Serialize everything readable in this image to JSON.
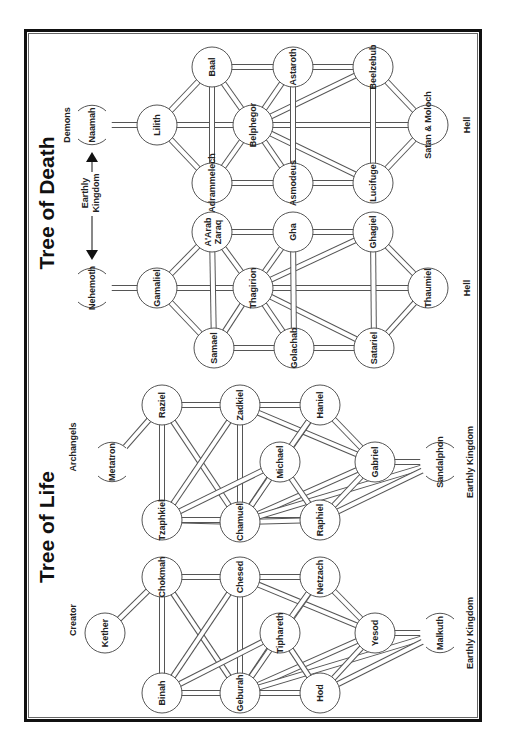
{
  "titles": {
    "death": "Tree of Death",
    "life": "Tree of Life"
  },
  "labels": {
    "demons": "Demons",
    "earthly": "Earthly",
    "kingdom": "Kingdom",
    "hell_1": "Hell",
    "hell_2": "Hell",
    "archangels": "Archangels",
    "creator": "Creator",
    "earthly_kingdom_1": "Earthly Kingdom",
    "earthly_kingdom_2": "Earthly Kingdom"
  },
  "colors": {
    "line": "#555555",
    "frame": "#111111",
    "text": "#222222",
    "background": "#ffffff"
  },
  "trees": [
    {
      "name": "Tree of Death — Demons",
      "nodes": [
        {
          "id": "naamah",
          "label": "Naamah",
          "x": 92,
          "y": 125,
          "open": true
        },
        {
          "id": "lilith",
          "label": "Lilith",
          "x": 157,
          "y": 125
        },
        {
          "id": "baal",
          "label": "Baal",
          "x": 212,
          "y": 67
        },
        {
          "id": "adrammelech",
          "label": "Adrammelech",
          "x": 212,
          "y": 183
        },
        {
          "id": "belphegor",
          "label": "Belphegor",
          "x": 253,
          "y": 125
        },
        {
          "id": "astaroth",
          "label": "Astaroth",
          "x": 293,
          "y": 67
        },
        {
          "id": "asmodeus",
          "label": "Asmodeus",
          "x": 293,
          "y": 183
        },
        {
          "id": "beelzebub",
          "label": "Beelzebub",
          "x": 373,
          "y": 67
        },
        {
          "id": "lucifuge",
          "label": "Lucifuge",
          "x": 373,
          "y": 183
        },
        {
          "id": "satan",
          "label": "Satan & Moloch",
          "x": 428,
          "y": 125
        }
      ]
    },
    {
      "name": "Tree of Death — Qliphoth",
      "nodes": [
        {
          "id": "nehemoth",
          "label": "Nehemoth",
          "x": 92,
          "y": 288,
          "open": true
        },
        {
          "id": "gamaliel",
          "label": "Gamaliel",
          "x": 157,
          "y": 288
        },
        {
          "id": "aarab",
          "label": "A'Arab",
          "label2": "Zaraq",
          "x": 212,
          "y": 232
        },
        {
          "id": "samael",
          "label": "Samael",
          "x": 214,
          "y": 348
        },
        {
          "id": "thagirion",
          "label": "Thagirion",
          "x": 253,
          "y": 288
        },
        {
          "id": "gha",
          "label": "Gha",
          "x": 293,
          "y": 232
        },
        {
          "id": "golachab",
          "label": "Golachab",
          "x": 294,
          "y": 348
        },
        {
          "id": "ghagiel",
          "label": "Ghagiel",
          "x": 373,
          "y": 232
        },
        {
          "id": "satariel",
          "label": "Satariel",
          "x": 374,
          "y": 348
        },
        {
          "id": "thaumiel",
          "label": "Thaumiel",
          "x": 428,
          "y": 288
        }
      ]
    },
    {
      "name": "Tree of Life — Archangels",
      "nodes": [
        {
          "id": "metatron",
          "label": "Metatron",
          "x": 112,
          "y": 462,
          "open": true
        },
        {
          "id": "raziel",
          "label": "Raziel",
          "x": 162,
          "y": 405
        },
        {
          "id": "tzaphkiel",
          "label": "Tzaphkiel",
          "x": 162,
          "y": 520
        },
        {
          "id": "zadkiel",
          "label": "Zadkiel",
          "x": 240,
          "y": 405
        },
        {
          "id": "chamuel",
          "label": "Chamuel",
          "x": 240,
          "y": 522
        },
        {
          "id": "michael",
          "label": "Michael",
          "x": 280,
          "y": 462
        },
        {
          "id": "haniel",
          "label": "Haniel",
          "x": 320,
          "y": 405
        },
        {
          "id": "raphiel",
          "label": "Raphiel",
          "x": 320,
          "y": 520
        },
        {
          "id": "gabriel",
          "label": "Gabriel",
          "x": 375,
          "y": 462
        },
        {
          "id": "sandalphon",
          "label": "Sandalphon",
          "x": 440,
          "y": 462,
          "open": true
        }
      ]
    },
    {
      "name": "Tree of Life — Sephiroth",
      "nodes": [
        {
          "id": "kether",
          "label": "Kether",
          "x": 105,
          "y": 633
        },
        {
          "id": "chokmah",
          "label": "Chokmah",
          "x": 162,
          "y": 577
        },
        {
          "id": "binah",
          "label": "Binah",
          "x": 162,
          "y": 693
        },
        {
          "id": "chesed",
          "label": "Chesed",
          "x": 240,
          "y": 577
        },
        {
          "id": "geburah",
          "label": "Geburah",
          "x": 240,
          "y": 693
        },
        {
          "id": "tiphareth",
          "label": "Tiphareth",
          "x": 280,
          "y": 633
        },
        {
          "id": "netzach",
          "label": "Netzach",
          "x": 320,
          "y": 577
        },
        {
          "id": "hod",
          "label": "Hod",
          "x": 320,
          "y": 693
        },
        {
          "id": "yesod",
          "label": "Yesod",
          "x": 375,
          "y": 633
        },
        {
          "id": "malkuth",
          "label": "Malkuth",
          "x": 440,
          "y": 633,
          "open": true
        }
      ]
    }
  ],
  "edge_pattern": [
    [
      0,
      1
    ],
    [
      1,
      2
    ],
    [
      1,
      3
    ],
    [
      1,
      4
    ],
    [
      2,
      3
    ],
    [
      2,
      4
    ],
    [
      3,
      4
    ],
    [
      2,
      5
    ],
    [
      3,
      6
    ],
    [
      2,
      7
    ],
    [
      3,
      8
    ],
    [
      4,
      5
    ],
    [
      4,
      6
    ],
    [
      4,
      7
    ],
    [
      4,
      8
    ],
    [
      4,
      9
    ],
    [
      5,
      6
    ],
    [
      5,
      7
    ],
    [
      6,
      8
    ],
    [
      7,
      8
    ],
    [
      7,
      9
    ],
    [
      8,
      9
    ]
  ],
  "ring_edges": [
    [
      1,
      4
    ],
    [
      2,
      4
    ]
  ]
}
